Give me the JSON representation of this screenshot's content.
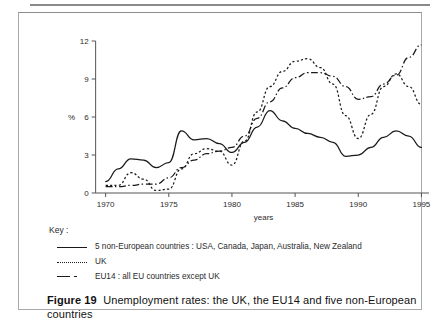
{
  "figure": {
    "label": "Figure 19",
    "caption": "Unemployment rates: the UK, the EU14 and five non-European countries"
  },
  "key": {
    "title": "Key :",
    "entries": [
      {
        "style": "solid",
        "label": "5 non-European countries :  USA, Canada, Japan, Australia, New Zealand"
      },
      {
        "style": "dotted",
        "label": "UK"
      },
      {
        "style": "dashdot",
        "label": "EU14 : all EU countries except UK"
      }
    ]
  },
  "chart_data": {
    "type": "line",
    "title": "",
    "xlabel": "years",
    "ylabel": "%",
    "xlim": [
      1969,
      1995.6
    ],
    "ylim": [
      0,
      12
    ],
    "xticks": [
      1970,
      1975,
      1980,
      1985,
      1990,
      1995
    ],
    "yticks": [
      0,
      3,
      6,
      9,
      12
    ],
    "xtick_labels": [
      "1970",
      "1975",
      "1980",
      "1985",
      "1990",
      "1995"
    ],
    "ytick_labels": [
      "0",
      "3",
      "6",
      "9",
      "12"
    ],
    "grid": false,
    "legend_position": "below-plot",
    "x": [
      1970,
      1971,
      1972,
      1973,
      1974,
      1975,
      1976,
      1977,
      1978,
      1979,
      1980,
      1981,
      1982,
      1983,
      1984,
      1985,
      1986,
      1987,
      1988,
      1989,
      1990,
      1991,
      1992,
      1993,
      1994,
      1995
    ],
    "series": [
      {
        "name": "5 non-European countries : USA, Canada, Japan, Australia, New Zealand",
        "style": "solid",
        "values": [
          0.9,
          1.9,
          2.7,
          2.6,
          2.0,
          2.4,
          4.9,
          4.2,
          4.3,
          3.9,
          3.2,
          4.0,
          5.2,
          6.5,
          5.7,
          5.1,
          4.7,
          4.4,
          4.0,
          2.9,
          3.0,
          3.6,
          4.4,
          4.9,
          4.5,
          3.6
        ]
      },
      {
        "name": "UK",
        "style": "dotted",
        "values": [
          0.6,
          0.6,
          1.6,
          1.1,
          0.2,
          0.3,
          1.9,
          3.1,
          3.5,
          3.3,
          2.2,
          4.1,
          6.4,
          8.4,
          9.6,
          10.4,
          10.6,
          9.9,
          8.6,
          6.1,
          4.3,
          6.2,
          8.4,
          9.4,
          8.4,
          7.0
        ]
      },
      {
        "name": "EU14 : all EU countries except UK",
        "style": "dashdot",
        "values": [
          0.5,
          0.5,
          0.6,
          0.7,
          0.7,
          1.2,
          2.0,
          2.6,
          3.1,
          3.3,
          3.6,
          4.5,
          5.9,
          7.2,
          8.3,
          9.1,
          9.5,
          9.5,
          9.2,
          8.4,
          7.4,
          7.6,
          8.6,
          9.3,
          10.7,
          11.7
        ]
      }
    ]
  }
}
